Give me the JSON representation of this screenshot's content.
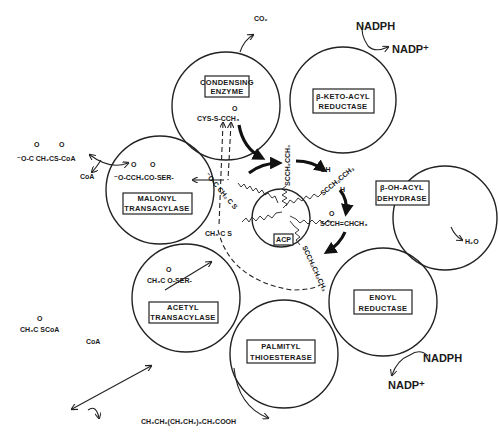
{
  "diagram": {
    "enzymes": [
      {
        "id": "condensing",
        "line1": "CONDENSING",
        "line2": "ENZYME"
      },
      {
        "id": "keto_reductase",
        "line1": "β-KETO-ACYL",
        "line2": "REDUCTASE"
      },
      {
        "id": "dehydrase",
        "line1": "β-OH-ACYL",
        "line2": "DEHYDRASE"
      },
      {
        "id": "enoyl_reductase",
        "line1": "ENOYL",
        "line2": "REDUCTASE"
      },
      {
        "id": "thioesterase",
        "line1": "PALMITYL",
        "line2": "THIOESTERASE"
      },
      {
        "id": "acetyl_transacylase",
        "line1": "ACETYL",
        "line2": "TRANSACYLASE"
      },
      {
        "id": "malonyl_transacylase",
        "line1": "MALONYL",
        "line2": "TRANSACYLASE"
      }
    ],
    "center": {
      "label": "ACP"
    },
    "cofactors": {
      "co2": "CO₂",
      "nadph_top": "NADPH",
      "nadp_top": "NADP⁺",
      "h2o": "H₂O",
      "nadph_bottom": "NADPH",
      "nadp_bottom": "NADP⁺"
    },
    "chemicals": {
      "condensing_bound": "CYS-S-CCH₃",
      "malonyl_coa": "⁻O-C CH₂CS-CoA",
      "coa_malonyl": "CoA",
      "malonyl_bound": "⁻O-CCH₂CO-SER-",
      "acetyl_coa": "CH₃C SCoA",
      "coa_acetyl": "CoA",
      "acetyl_bound": "CH₃C O-SER-",
      "acetoacetyl": "SCCH₂CCH₃",
      "hydroxybutyryl": "SCCH₂CCH₃",
      "crotonyl": "SCCH=CHCH₃",
      "butyryl": "SCCH₂CH₂CH₃",
      "malonyl_acp": "⁻O-C CH₂ C S",
      "acetyl_acp": "CH₃ C S",
      "oh_label": "OH",
      "h_label": "H",
      "oxo": "O",
      "palmitate": "CH₃CH₂(CH₂CH₂)₆CH₂COOH"
    }
  }
}
